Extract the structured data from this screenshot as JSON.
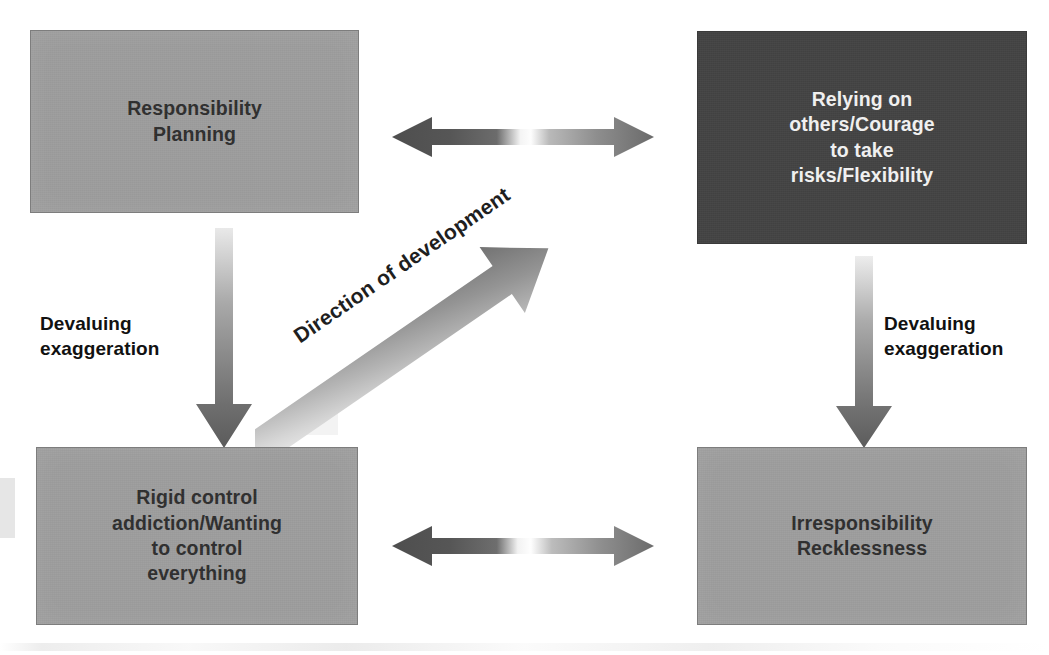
{
  "diagram": {
    "title": "Direction of development",
    "type": "four-quadrant-development-diagram",
    "colors": {
      "box_light_fill": "#9d9d9d",
      "box_dark_fill": "#434343",
      "box_border": "#7d7d7d",
      "light_text": "#f2f2f2",
      "dark_text": "#2e2e2e",
      "caption_text": "#111111",
      "arrow_dark": "#585858",
      "arrow_light": "#f1f1f1",
      "background": "#ffffff"
    },
    "boxes": {
      "top_left": {
        "text": "Responsibility\nPlanning",
        "fill": "#9d9d9d",
        "text_color": "#2e2e2e"
      },
      "top_right": {
        "text": "Relying on\nothers/Courage\nto take\nrisks/Flexibility",
        "fill": "#434343",
        "text_color": "#f2f2f2"
      },
      "bottom_left": {
        "text": "Rigid control\naddiction/Wanting\nto control\neverything",
        "fill": "#9d9d9d",
        "text_color": "#2e2e2e"
      },
      "bottom_right": {
        "text": "Irresponsibility\nRecklessness",
        "fill": "#9d9d9d",
        "text_color": "#2e2e2e"
      }
    },
    "captions": {
      "left": "Devaluing\nexaggeration",
      "right": "Devaluing\nexaggeration"
    },
    "arrows": {
      "diagonal_label": "Direction of development",
      "top_horizontal": "double-headed-tension-arrow",
      "bottom_horizontal": "double-headed-tension-arrow",
      "left_vertical": "downward-devaluation-arrow",
      "right_vertical": "downward-devaluation-arrow",
      "diagonal": "upward-development-arrow"
    }
  }
}
